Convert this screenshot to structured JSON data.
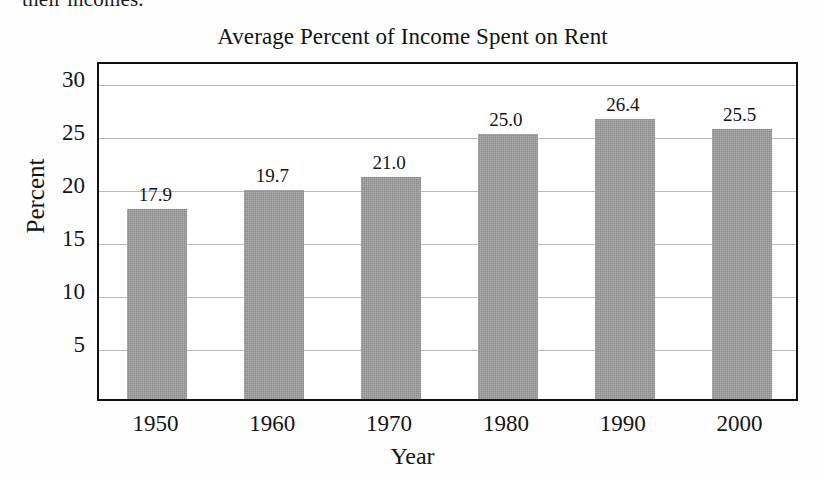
{
  "page": {
    "cropped_body_text": "their incomes."
  },
  "chart_data": {
    "type": "bar",
    "title": "Average Percent of Income Spent on Rent",
    "xlabel": "Year",
    "ylabel": "Percent",
    "categories": [
      "1950",
      "1960",
      "1970",
      "1980",
      "1990",
      "2000"
    ],
    "values": [
      17.9,
      19.7,
      21.0,
      25.0,
      26.4,
      25.5
    ],
    "data_labels": [
      "17.9",
      "19.7",
      "21.0",
      "25.0",
      "26.4",
      "25.5"
    ],
    "ylim": [
      0,
      32
    ],
    "yticks": [
      5,
      10,
      15,
      20,
      25,
      30
    ],
    "ytick_labels": [
      "5",
      "10",
      "15",
      "20",
      "25",
      "30"
    ],
    "grid": "horizontal",
    "legend": "none",
    "bar_color": "#9b9b9b",
    "frame_color": "#111111",
    "gridline_color": "#b9b9b9"
  }
}
